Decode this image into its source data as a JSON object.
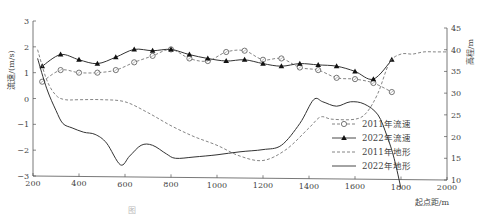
{
  "chart_data": {
    "type": "line",
    "title": "",
    "xlabel": "起点距/m",
    "ylabel": "流速/(m/s)",
    "ylabel_right": "高程/m",
    "xlim": [
      200,
      2000
    ],
    "ylim": [
      -3,
      3
    ],
    "ylim_right": [
      10,
      45
    ],
    "x_ticks": [
      200,
      400,
      600,
      800,
      1000,
      1200,
      1400,
      1600,
      1800,
      2000
    ],
    "y_ticks": [
      -3,
      -2,
      -1,
      0,
      1,
      2,
      3
    ],
    "y_ticks_right": [
      10,
      15,
      20,
      25,
      30,
      35,
      40,
      45
    ],
    "grid": false,
    "legend_position": "lower right",
    "series": [
      {
        "name": "2011年流速",
        "axis": "left",
        "style": "dashed",
        "marker": "circle-open",
        "x": [
          240,
          320,
          400,
          480,
          560,
          640,
          720,
          800,
          880,
          960,
          1040,
          1120,
          1200,
          1280,
          1360,
          1440,
          1520,
          1600,
          1680,
          1760
        ],
        "values": [
          0.65,
          1.1,
          1.0,
          1.0,
          1.1,
          1.4,
          1.65,
          1.9,
          1.55,
          1.45,
          1.8,
          1.85,
          1.5,
          1.55,
          1.2,
          1.1,
          0.8,
          0.75,
          0.6,
          0.25
        ]
      },
      {
        "name": "2022年流速",
        "axis": "left",
        "style": "solid",
        "marker": "triangle-filled",
        "x": [
          240,
          320,
          400,
          480,
          560,
          640,
          720,
          800,
          880,
          960,
          1040,
          1120,
          1200,
          1280,
          1360,
          1440,
          1520,
          1600,
          1680,
          1760
        ],
        "values": [
          1.25,
          1.7,
          1.5,
          1.35,
          1.6,
          1.9,
          1.85,
          1.9,
          1.7,
          1.55,
          1.45,
          1.5,
          1.35,
          1.25,
          1.35,
          1.3,
          1.25,
          1.05,
          0.75,
          1.5
        ]
      },
      {
        "name": "2011年地形",
        "axis": "right",
        "style": "dashed",
        "marker": "none",
        "x": [
          220,
          260,
          300,
          340,
          400,
          500,
          600,
          700,
          800,
          900,
          1000,
          1100,
          1200,
          1300,
          1400,
          1450,
          1500,
          1600,
          1650,
          1700,
          1750,
          1800,
          1850,
          1900,
          1950,
          2000
        ],
        "values": [
          40,
          33,
          29.5,
          28.5,
          28.5,
          28.5,
          28,
          25.5,
          22.5,
          20,
          18,
          15.5,
          14.5,
          17,
          22,
          24.5,
          24,
          24,
          25.5,
          30,
          37,
          39,
          39,
          39.5,
          39.5,
          39.5
        ]
      },
      {
        "name": "2022年地形",
        "axis": "right",
        "style": "solid",
        "marker": "none",
        "x": [
          220,
          260,
          300,
          330,
          370,
          420,
          470,
          520,
          580,
          620,
          670,
          720,
          780,
          820,
          900,
          1000,
          1100,
          1200,
          1280,
          1360,
          1420,
          1460,
          1520,
          1580,
          1640,
          1700,
          1740,
          1770,
          1800
        ],
        "values": [
          38,
          31,
          26,
          23,
          22,
          21,
          20.5,
          18.5,
          13.5,
          15.5,
          18,
          18,
          16,
          15,
          15.3,
          15.8,
          16.5,
          17,
          18,
          23,
          28.5,
          28,
          27,
          28,
          27.5,
          25,
          20,
          15,
          8
        ]
      }
    ]
  },
  "axes": {
    "xlabel": "起点距/m",
    "ylabel_left": "流速/(m/s)",
    "ylabel_right": "高程/m",
    "x_ticks": [
      "200",
      "400",
      "600",
      "800",
      "1000",
      "1200",
      "1400",
      "1600",
      "1800",
      "2000"
    ],
    "y_ticks_left": [
      "-3",
      "-2",
      "-1",
      "0",
      "1",
      "2",
      "3"
    ],
    "y_ticks_right": [
      "10",
      "15",
      "20",
      "25",
      "30",
      "35",
      "40",
      "45"
    ]
  },
  "legend": {
    "items": [
      "2011年流速",
      "2022年流速",
      "2011年地形",
      "2022年地形"
    ]
  },
  "caption": "图"
}
